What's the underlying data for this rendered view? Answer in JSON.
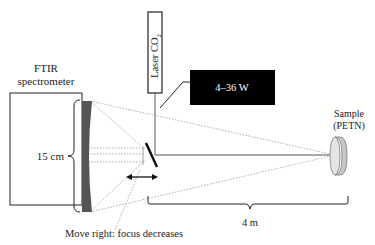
{
  "diagram": {
    "spectrometer_label_line1": "FTIR",
    "spectrometer_label_line2": "spectrometer",
    "laser_label": "Laser CO",
    "laser_subscript": "2",
    "power_label": "4–36 W",
    "mirror_size_label": "15 cm",
    "sample_label_line1": "Sample",
    "sample_label_line2": "(PETN)",
    "distance_label": "4 m",
    "move_note": "Move right: focus decreases"
  },
  "colors": {
    "line": "#222222",
    "dotted": "#9a9a9a",
    "mirror_fill": "#555555",
    "power_box": "#000000",
    "sample_fill": "#d8d8d8"
  }
}
